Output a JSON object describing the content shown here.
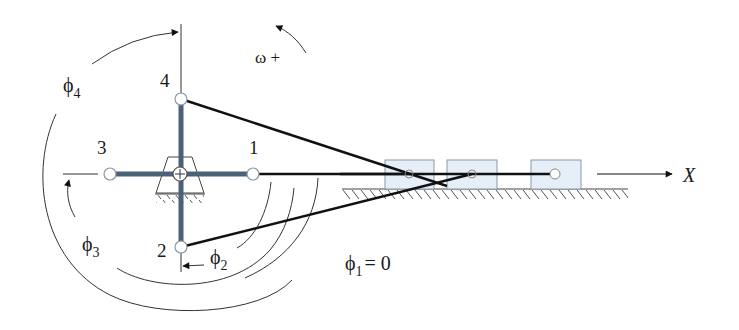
{
  "diagram": {
    "type": "four-crank slider mechanism",
    "crank_labels": [
      "1",
      "2",
      "3",
      "4"
    ],
    "angle_labels": {
      "phi2": {
        "symbol": "ϕ",
        "sub": "2"
      },
      "phi3": {
        "symbol": "ϕ",
        "sub": "3"
      },
      "phi4": {
        "symbol": "ϕ",
        "sub": "4"
      },
      "phi1": {
        "symbol": "ϕ",
        "sub": "1",
        "value": "= 0"
      }
    },
    "omega_label": "ω +",
    "axis_label": "X",
    "colors": {
      "crank": "#4a6178",
      "link": "#111111",
      "block_fill": "#e6eef7",
      "block_stroke": "#8a9aa8",
      "thin_line": "#444444"
    }
  }
}
